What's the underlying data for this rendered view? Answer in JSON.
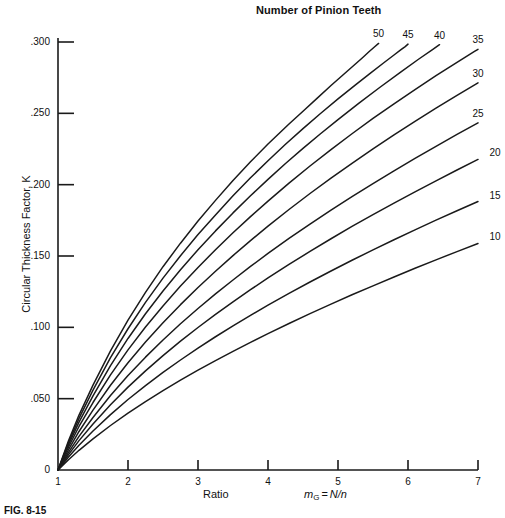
{
  "chart_data": {
    "type": "line",
    "title": "Number of Pinion Teeth",
    "xlabel_ratio": "Ratio",
    "xlabel_symbol": "m",
    "xlabel_subscript": "G",
    "xlabel_equals": "=",
    "xlabel_expression": "N/n",
    "ylabel": "Circular Thickness Factor, K",
    "xlim": [
      1,
      7
    ],
    "ylim": [
      0,
      0.315
    ],
    "xticks": [
      1,
      2,
      3,
      4,
      5,
      6,
      7
    ],
    "xtick_labels": [
      "1",
      "2",
      "3",
      "4",
      "5",
      "6",
      "7"
    ],
    "yticks": [
      0,
      0.05,
      0.1,
      0.15,
      0.2,
      0.25,
      0.3
    ],
    "ytick_labels": [
      "0",
      ".050",
      ".100",
      ".150",
      ".200",
      ".250",
      ".300"
    ],
    "grid": false,
    "legend_position": "inline-curve-labels",
    "line_color": "#1a1a1a",
    "axis_color": "#1a1a1a",
    "series": [
      {
        "name": "50",
        "label": "50",
        "label_side": "top",
        "points": [
          [
            1,
            0
          ],
          [
            1.15,
            0.0205
          ],
          [
            1.3,
            0.0385
          ],
          [
            1.5,
            0.0595
          ],
          [
            1.75,
            0.0835
          ],
          [
            2.0,
            0.105
          ],
          [
            2.25,
            0.1245
          ],
          [
            2.5,
            0.1425
          ],
          [
            2.75,
            0.159
          ],
          [
            3.0,
            0.1745
          ],
          [
            3.25,
            0.189
          ],
          [
            3.5,
            0.203
          ],
          [
            3.75,
            0.216
          ],
          [
            4.0,
            0.2285
          ],
          [
            4.15,
            0.2355
          ],
          [
            4.3,
            0.2425
          ],
          [
            4.5,
            0.2515
          ],
          [
            4.7,
            0.2605
          ],
          [
            4.9,
            0.2695
          ],
          [
            5.05,
            0.276
          ],
          [
            5.2,
            0.2825
          ],
          [
            5.35,
            0.289
          ],
          [
            5.45,
            0.2935
          ],
          [
            5.52,
            0.2965
          ],
          [
            5.58,
            0.299
          ]
        ]
      },
      {
        "name": "45",
        "label": "45",
        "label_side": "top",
        "points": [
          [
            1,
            0
          ],
          [
            1.15,
            0.0192
          ],
          [
            1.3,
            0.0362
          ],
          [
            1.5,
            0.056
          ],
          [
            1.75,
            0.0787
          ],
          [
            2.0,
            0.099
          ],
          [
            2.25,
            0.1175
          ],
          [
            2.5,
            0.1345
          ],
          [
            2.75,
            0.1502
          ],
          [
            3.0,
            0.165
          ],
          [
            3.25,
            0.1788
          ],
          [
            3.5,
            0.1922
          ],
          [
            3.75,
            0.2048
          ],
          [
            4.0,
            0.2168
          ],
          [
            4.25,
            0.2283
          ],
          [
            4.5,
            0.2393
          ],
          [
            4.75,
            0.2499
          ],
          [
            5.0,
            0.2601
          ],
          [
            5.25,
            0.27
          ],
          [
            5.45,
            0.2777
          ],
          [
            5.65,
            0.2853
          ],
          [
            5.8,
            0.2909
          ],
          [
            5.9,
            0.2946
          ],
          [
            5.96,
            0.2968
          ],
          [
            6.0,
            0.2985
          ]
        ]
      },
      {
        "name": "40",
        "label": "40",
        "label_side": "top",
        "points": [
          [
            1,
            0
          ],
          [
            1.15,
            0.0178
          ],
          [
            1.3,
            0.0336
          ],
          [
            1.5,
            0.052
          ],
          [
            1.75,
            0.0732
          ],
          [
            2.0,
            0.0922
          ],
          [
            2.25,
            0.1095
          ],
          [
            2.5,
            0.1255
          ],
          [
            2.75,
            0.1404
          ],
          [
            3.0,
            0.1544
          ],
          [
            3.25,
            0.1676
          ],
          [
            3.5,
            0.1802
          ],
          [
            3.75,
            0.1922
          ],
          [
            4.0,
            0.2037
          ],
          [
            4.25,
            0.2148
          ],
          [
            4.5,
            0.2254
          ],
          [
            4.75,
            0.2357
          ],
          [
            5.0,
            0.2456
          ],
          [
            5.3,
            0.2572
          ],
          [
            5.6,
            0.2683
          ],
          [
            5.9,
            0.2791
          ],
          [
            6.15,
            0.2879
          ],
          [
            6.35,
            0.2947
          ],
          [
            6.45,
            0.2981
          ]
        ]
      },
      {
        "name": "35",
        "label": "35",
        "label_side": "top",
        "points": [
          [
            1,
            0
          ],
          [
            1.15,
            0.0161
          ],
          [
            1.3,
            0.0305
          ],
          [
            1.5,
            0.0473
          ],
          [
            1.75,
            0.0667
          ],
          [
            2.0,
            0.0842
          ],
          [
            2.25,
            0.1002
          ],
          [
            2.5,
            0.115
          ],
          [
            2.75,
            0.1289
          ],
          [
            3.0,
            0.142
          ],
          [
            3.25,
            0.1544
          ],
          [
            3.5,
            0.1663
          ],
          [
            3.75,
            0.1776
          ],
          [
            4.0,
            0.1885
          ],
          [
            4.3,
            0.2011
          ],
          [
            4.6,
            0.2131
          ],
          [
            4.9,
            0.2246
          ],
          [
            5.2,
            0.2357
          ],
          [
            5.5,
            0.2464
          ],
          [
            5.8,
            0.2567
          ],
          [
            6.1,
            0.2667
          ],
          [
            6.4,
            0.2764
          ],
          [
            6.7,
            0.2858
          ],
          [
            6.95,
            0.2934
          ],
          [
            7.0,
            0.2949
          ]
        ]
      },
      {
        "name": "30",
        "label": "30",
        "label_side": "top",
        "points": [
          [
            1,
            0
          ],
          [
            1.15,
            0.0142
          ],
          [
            1.3,
            0.027
          ],
          [
            1.5,
            0.042
          ],
          [
            1.75,
            0.0594
          ],
          [
            2.0,
            0.0752
          ],
          [
            2.25,
            0.0897
          ],
          [
            2.5,
            0.1032
          ],
          [
            2.75,
            0.1159
          ],
          [
            3.0,
            0.1279
          ],
          [
            3.25,
            0.1393
          ],
          [
            3.5,
            0.1503
          ],
          [
            3.75,
            0.1608
          ],
          [
            4.0,
            0.1709
          ],
          [
            4.3,
            0.1826
          ],
          [
            4.6,
            0.1938
          ],
          [
            4.9,
            0.2046
          ],
          [
            5.2,
            0.215
          ],
          [
            5.5,
            0.2251
          ],
          [
            5.8,
            0.2349
          ],
          [
            6.1,
            0.2444
          ],
          [
            6.4,
            0.2536
          ],
          [
            6.7,
            0.2626
          ],
          [
            7.0,
            0.2714
          ]
        ]
      },
      {
        "name": "25",
        "label": "25",
        "label_side": "top",
        "points": [
          [
            1,
            0
          ],
          [
            1.15,
            0.0124
          ],
          [
            1.3,
            0.0236
          ],
          [
            1.5,
            0.0368
          ],
          [
            1.75,
            0.0522
          ],
          [
            2.0,
            0.0662
          ],
          [
            2.25,
            0.0791
          ],
          [
            2.5,
            0.0911
          ],
          [
            2.75,
            0.1025
          ],
          [
            3.0,
            0.1132
          ],
          [
            3.25,
            0.1234
          ],
          [
            3.5,
            0.1332
          ],
          [
            3.75,
            0.1427
          ],
          [
            4.0,
            0.1518
          ],
          [
            4.3,
            0.1623
          ],
          [
            4.6,
            0.1724
          ],
          [
            4.9,
            0.1822
          ],
          [
            5.2,
            0.1916
          ],
          [
            5.5,
            0.2008
          ],
          [
            5.8,
            0.2097
          ],
          [
            6.1,
            0.2184
          ],
          [
            6.4,
            0.2269
          ],
          [
            6.7,
            0.2352
          ],
          [
            7.0,
            0.2433
          ]
        ]
      },
      {
        "name": "20",
        "label": "20",
        "label_side": "right",
        "points": [
          [
            1,
            0
          ],
          [
            1.15,
            0.0108
          ],
          [
            1.3,
            0.0206
          ],
          [
            1.5,
            0.0322
          ],
          [
            1.75,
            0.0457
          ],
          [
            2.0,
            0.0581
          ],
          [
            2.25,
            0.0695
          ],
          [
            2.5,
            0.0802
          ],
          [
            2.75,
            0.0903
          ],
          [
            3.0,
            0.0999
          ],
          [
            3.25,
            0.1091
          ],
          [
            3.5,
            0.1179
          ],
          [
            3.75,
            0.1264
          ],
          [
            4.0,
            0.1346
          ],
          [
            4.3,
            0.1441
          ],
          [
            4.6,
            0.1532
          ],
          [
            4.9,
            0.1621
          ],
          [
            5.2,
            0.1707
          ],
          [
            5.5,
            0.179
          ],
          [
            5.8,
            0.1871
          ],
          [
            6.1,
            0.195
          ],
          [
            6.4,
            0.2027
          ],
          [
            6.7,
            0.2103
          ],
          [
            7.0,
            0.2177
          ]
        ]
      },
      {
        "name": "15",
        "label": "15",
        "label_side": "right",
        "points": [
          [
            1,
            0
          ],
          [
            1.15,
            0.0091
          ],
          [
            1.3,
            0.0174
          ],
          [
            1.5,
            0.0273
          ],
          [
            1.75,
            0.0388
          ],
          [
            2.0,
            0.0494
          ],
          [
            2.25,
            0.0592
          ],
          [
            2.5,
            0.0684
          ],
          [
            2.75,
            0.0771
          ],
          [
            3.0,
            0.0854
          ],
          [
            3.25,
            0.0934
          ],
          [
            3.5,
            0.101
          ],
          [
            3.75,
            0.1084
          ],
          [
            4.0,
            0.1155
          ],
          [
            4.3,
            0.1238
          ],
          [
            4.6,
            0.1318
          ],
          [
            4.9,
            0.1395
          ],
          [
            5.2,
            0.147
          ],
          [
            5.5,
            0.1543
          ],
          [
            5.8,
            0.1614
          ],
          [
            6.1,
            0.1683
          ],
          [
            6.4,
            0.1751
          ],
          [
            6.7,
            0.1817
          ],
          [
            7.0,
            0.1882
          ]
        ]
      },
      {
        "name": "10",
        "label": "10",
        "label_side": "right",
        "points": [
          [
            1,
            0
          ],
          [
            1.15,
            0.0072
          ],
          [
            1.3,
            0.0138
          ],
          [
            1.5,
            0.0218
          ],
          [
            1.75,
            0.0312
          ],
          [
            2.0,
            0.0399
          ],
          [
            2.25,
            0.048
          ],
          [
            2.5,
            0.0557
          ],
          [
            2.75,
            0.063
          ],
          [
            3.0,
            0.07
          ],
          [
            3.25,
            0.0767
          ],
          [
            3.5,
            0.0832
          ],
          [
            3.75,
            0.0895
          ],
          [
            4.0,
            0.0956
          ],
          [
            4.3,
            0.1027
          ],
          [
            4.6,
            0.1096
          ],
          [
            4.9,
            0.1163
          ],
          [
            5.2,
            0.1228
          ],
          [
            5.5,
            0.1291
          ],
          [
            5.8,
            0.1353
          ],
          [
            6.1,
            0.1414
          ],
          [
            6.4,
            0.1473
          ],
          [
            6.7,
            0.1531
          ],
          [
            7.0,
            0.1588
          ]
        ]
      }
    ]
  },
  "caption": {
    "text": "FIG. 8-15"
  }
}
